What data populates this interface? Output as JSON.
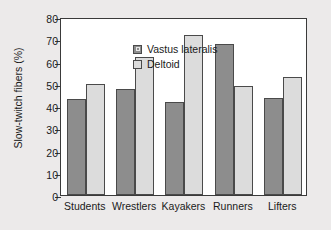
{
  "chart_data": {
    "type": "bar",
    "title": "",
    "xlabel": "",
    "ylabel": "Slow-twitch fibers (%)",
    "categories": [
      "Students",
      "Wrestlers",
      "Kayakers",
      "Runners",
      "Lifters"
    ],
    "series": [
      {
        "name": "Vastus lateralis",
        "color": "#8d8d8d",
        "values": [
          43,
          47.5,
          42,
          68,
          43.5
        ]
      },
      {
        "name": "Deltoid",
        "color": "#dcdcdc",
        "values": [
          50,
          62,
          72,
          49,
          53
        ]
      }
    ],
    "ylim": [
      0,
      80
    ],
    "yticks": [
      0,
      10,
      20,
      30,
      40,
      50,
      60,
      70,
      80
    ],
    "ytick_labels": [
      "0",
      "10",
      "20",
      "30",
      "40",
      "50",
      "60",
      "70",
      "80"
    ],
    "grid": false,
    "legend_position": "top-left",
    "background_color": "#eceaea",
    "plot_background_color": "#ffffff",
    "axis_color": "#3a3a3a"
  }
}
